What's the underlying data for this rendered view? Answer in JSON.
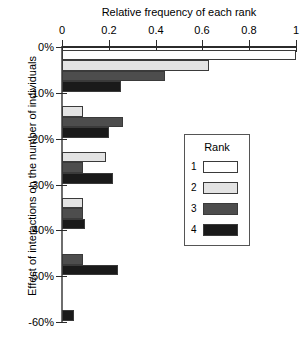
{
  "chart_data": {
    "type": "bar",
    "orientation": "horizontal",
    "title": "",
    "xlabel": "Relative frequency of each rank",
    "ylabel": "Effect of interactions on the number of individuals",
    "xlim": [
      0,
      1
    ],
    "xticks": [
      0,
      0.2,
      0.4,
      0.6,
      0.8,
      1
    ],
    "xtick_labels": [
      "0",
      "0.2",
      "0.4",
      "0.6",
      "0.8",
      "1"
    ],
    "ylim": [
      -60,
      0
    ],
    "yticks": [
      0,
      -10,
      -20,
      -30,
      -40,
      -50,
      -60
    ],
    "ytick_labels": [
      "0%",
      "-10%",
      "-20%",
      "-30%",
      "-40%",
      "-50%",
      "-60%"
    ],
    "grid": false,
    "legend": {
      "title": "Rank",
      "position": "center-right",
      "entries": [
        {
          "label": "1",
          "color": "#ffffff"
        },
        {
          "label": "2",
          "color": "#e3e3e3"
        },
        {
          "label": "3",
          "color": "#4d4d4d"
        },
        {
          "label": "4",
          "color": "#1a1a1a"
        }
      ]
    },
    "categories": [
      "0% to -10%",
      "-10% to -20%",
      "-20% to -30%",
      "-30% to -40%",
      "-40% to -50%",
      "-50% to -60%"
    ],
    "series": [
      {
        "name": "1",
        "color": "#ffffff",
        "values": [
          1.0,
          0.0,
          0.0,
          0.0,
          0.0,
          0.0
        ]
      },
      {
        "name": "2",
        "color": "#e3e3e3",
        "values": [
          0.63,
          0.09,
          0.19,
          0.09,
          0.0,
          0.0
        ]
      },
      {
        "name": "3",
        "color": "#4d4d4d",
        "values": [
          0.44,
          0.26,
          0.09,
          0.09,
          0.09,
          0.0
        ]
      },
      {
        "name": "4",
        "color": "#1a1a1a",
        "values": [
          0.25,
          0.2,
          0.22,
          0.1,
          0.24,
          0.05
        ]
      }
    ]
  },
  "caption": {
    "sliver_text": ""
  }
}
